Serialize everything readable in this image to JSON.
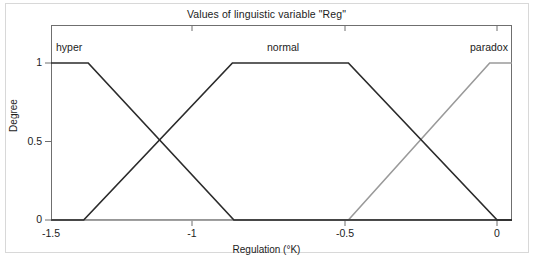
{
  "figure": {
    "title": "Values of linguistic variable \"Reg\"",
    "caption": ""
  },
  "axes": {
    "ylabel": "Degree",
    "xlabel": "Regulation (°K)",
    "yticks": [
      "0",
      "0.5",
      "1"
    ],
    "xticks": [
      "-1.5",
      "-1",
      "-0.5",
      "0"
    ]
  },
  "set_labels": {
    "hyper": "hyper",
    "normal": "normal",
    "paradox": "paradox"
  },
  "colors": {
    "hyper": "#2b2b2b",
    "normal": "#2b2b2b",
    "paradox": "#9a9a9a",
    "axis": "#6f6f6f",
    "frame": "#d8d8d8",
    "text": "#1c1c1c"
  },
  "chart_data": {
    "type": "line",
    "title": "Values of linguistic variable \"Reg\"",
    "xlabel": "Regulation (°K)",
    "ylabel": "Degree",
    "xlim": [
      -1.5,
      0.05
    ],
    "ylim": [
      0,
      1
    ],
    "xticks": [
      -1.5,
      -1,
      -0.5,
      0
    ],
    "yticks": [
      0,
      0.5,
      1
    ],
    "grid": false,
    "legend": "inline-annotations",
    "series": [
      {
        "name": "hyper",
        "color": "#2b2b2b",
        "type": "trapezoidal-membership",
        "x": [
          -1.5,
          -1.375,
          -0.885,
          0.05
        ],
        "y": [
          1,
          1,
          0,
          0
        ]
      },
      {
        "name": "normal",
        "color": "#2b2b2b",
        "type": "trapezoidal-membership",
        "x": [
          -1.5,
          -1.39,
          -0.89,
          -0.5,
          0.0,
          0.05
        ],
        "y": [
          0,
          0,
          1,
          1,
          0,
          0
        ]
      },
      {
        "name": "paradox",
        "color": "#9a9a9a",
        "type": "trapezoidal-membership",
        "x": [
          -1.5,
          -0.5,
          -0.025,
          0.05
        ],
        "y": [
          0,
          0,
          1,
          1
        ]
      }
    ]
  }
}
